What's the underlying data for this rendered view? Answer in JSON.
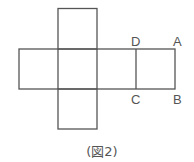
{
  "figure": {
    "caption": "(図2)",
    "line_color": "#555555",
    "labels": {
      "D": "D",
      "A": "A",
      "C": "C",
      "B": "B"
    }
  }
}
